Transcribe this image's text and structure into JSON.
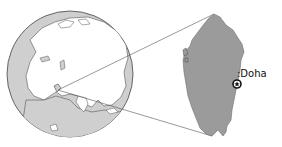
{
  "map": {
    "type": "locator-map",
    "description": "Orthographic globe centered on Asia with inset enlarging Qatar",
    "globe": {
      "center_region": "Asia",
      "highlighted_location": "Qatar"
    },
    "inset": {
      "country": "Qatar",
      "land_color": "#9b9b9b",
      "marker": {
        "symbol": "star-in-circle",
        "label": "Doha"
      }
    },
    "colors": {
      "land": "#c4c4c4",
      "ocean": "#ffffff",
      "outline": "#3a3a3a",
      "inset_land": "#9b9b9b",
      "connector": "#555555"
    }
  },
  "labels": {
    "doha": ":Doha"
  }
}
